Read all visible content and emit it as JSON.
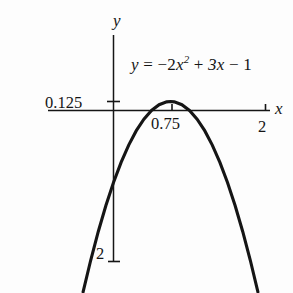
{
  "figure": {
    "background_color": "#fdfdfd",
    "ink_color": "#151515",
    "axis_names": {
      "x": "x",
      "y": "y"
    },
    "equation_parts": {
      "lhs": "y",
      "equals": "=",
      "term1_coefficient": "−2",
      "term1_variable": "x",
      "term1_exponent": "2",
      "plus": "+",
      "term2": "3x",
      "minus": "−",
      "constant": "1"
    },
    "equation_text": "y = −2x² + 3x − 1"
  },
  "chart_data": {
    "type": "line",
    "title": "",
    "subtitle": "",
    "xlabel": "x",
    "ylabel": "y",
    "annotations": [
      {
        "name": "equation-annotation",
        "text": "y = −2x² + 3x − 1",
        "x": 1.05,
        "y": 0.75
      }
    ],
    "function": "y = -2x^2 + 3x - 1",
    "coefficients": {
      "a": -2,
      "b": 3,
      "c": -1
    },
    "vertex": {
      "x": 0.75,
      "y": 0.125
    },
    "y_intercept": -2,
    "xlim": [
      -0.45,
      2.25
    ],
    "ylim": [
      -2.35,
      1.35
    ],
    "grid": false,
    "legend": false,
    "legend_position": "none",
    "x_ticks": [
      {
        "value": 0.75,
        "label": "0.75"
      },
      {
        "value": 2,
        "label": "2"
      }
    ],
    "y_ticks": [
      {
        "value": 0.125,
        "label": "0.125"
      },
      {
        "value": -2,
        "label": "2"
      }
    ],
    "x": [
      -0.4,
      -0.3,
      -0.2,
      -0.1,
      0,
      0.1,
      0.2,
      0.3,
      0.4,
      0.5,
      0.6,
      0.7,
      0.75,
      0.8,
      0.9,
      1.0,
      1.1,
      1.2,
      1.3,
      1.4,
      1.5,
      1.6,
      1.7,
      1.8,
      1.9
    ],
    "y": [
      -2.52,
      -2.08,
      -1.68,
      -1.32,
      -1.0,
      -0.72,
      -0.48,
      -0.28,
      -0.12,
      0.0,
      0.08,
      0.12,
      0.125,
      0.12,
      0.08,
      0.0,
      -0.12,
      -0.28,
      -0.48,
      -0.72,
      -1.0,
      -1.32,
      -1.68,
      -2.08,
      -2.52
    ]
  },
  "labels": {
    "y_tick_0125": "0.125",
    "x_tick_075": "0.75",
    "x_tick_2": "2",
    "y_tick_neg2": "2",
    "x_axis": "x",
    "y_axis": "y"
  }
}
